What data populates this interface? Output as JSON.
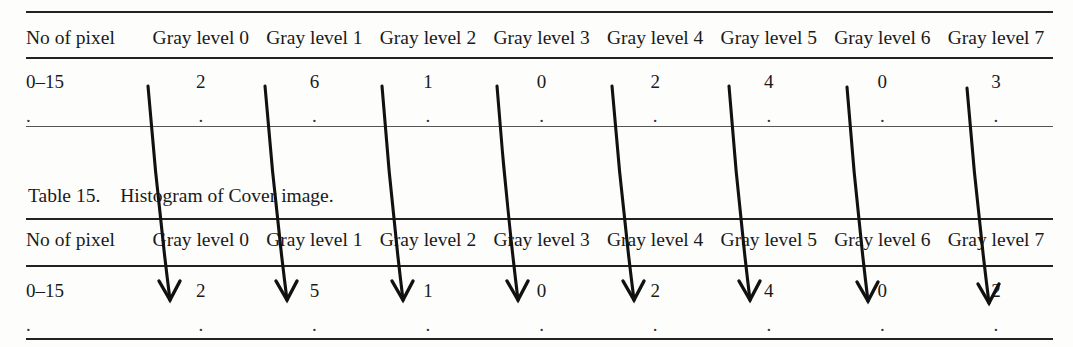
{
  "page": {
    "background_color": "#fdfdfc",
    "ink_color": "#1a1a1a"
  },
  "table_top": {
    "name": "upper-histogram-table",
    "columns": [
      "No of pixel",
      "Gray level 0",
      "Gray level 1",
      "Gray level 2",
      "Gray level 3",
      "Gray level 4",
      "Gray level 5",
      "Gray level 6",
      "Gray level 7"
    ],
    "rows": [
      {
        "label": "0–15",
        "values": [
          "2",
          "6",
          "1",
          "0",
          "2",
          "4",
          "0",
          "3"
        ]
      },
      {
        "label": ".",
        "values": [
          ".",
          ".",
          ".",
          ".",
          ".",
          ".",
          ".",
          "."
        ]
      }
    ]
  },
  "caption": {
    "number": "Table 15.",
    "text": "Histogram of Cover image."
  },
  "table_bottom": {
    "name": "lower-histogram-table",
    "columns": [
      "No of pixel",
      "Gray level 0",
      "Gray level 1",
      "Gray level 2",
      "Gray level 3",
      "Gray level 4",
      "Gray level 5",
      "Gray level 6",
      "Gray level 7"
    ],
    "rows": [
      {
        "label": "0–15",
        "values": [
          "2",
          "5",
          "1",
          "0",
          "2",
          "4",
          "0",
          "2"
        ]
      },
      {
        "label": ".",
        "values": [
          ".",
          ".",
          ".",
          ".",
          ".",
          ".",
          ".",
          "."
        ]
      }
    ]
  },
  "annotations": {
    "type": "hand-drawn-arrows",
    "count": 8,
    "description": "Diagonal arrows drawn from each gray-level value of the upper table down to the corresponding value of the lower table",
    "color": "#111111",
    "arrows": [
      {
        "from_column": "Gray level 0",
        "from_value": "2",
        "to_value": "2",
        "x1": 148,
        "y1": 86,
        "x2": 170,
        "y2": 300
      },
      {
        "from_column": "Gray level 1",
        "from_value": "6",
        "to_value": "5",
        "x1": 265,
        "y1": 86,
        "x2": 287,
        "y2": 300
      },
      {
        "from_column": "Gray level 2",
        "from_value": "1",
        "to_value": "1",
        "x1": 382,
        "y1": 86,
        "x2": 403,
        "y2": 300
      },
      {
        "from_column": "Gray level 3",
        "from_value": "0",
        "to_value": "0",
        "x1": 497,
        "y1": 86,
        "x2": 518,
        "y2": 300
      },
      {
        "from_column": "Gray level 4",
        "from_value": "2",
        "to_value": "2",
        "x1": 612,
        "y1": 86,
        "x2": 634,
        "y2": 300
      },
      {
        "from_column": "Gray level 5",
        "from_value": "4",
        "to_value": "4",
        "x1": 729,
        "y1": 86,
        "x2": 750,
        "y2": 300
      },
      {
        "from_column": "Gray level 6",
        "from_value": "0",
        "to_value": "0",
        "x1": 847,
        "y1": 87,
        "x2": 868,
        "y2": 301
      },
      {
        "from_column": "Gray level 7",
        "from_value": "3",
        "to_value": "2",
        "x1": 967,
        "y1": 88,
        "x2": 989,
        "y2": 303
      }
    ]
  }
}
